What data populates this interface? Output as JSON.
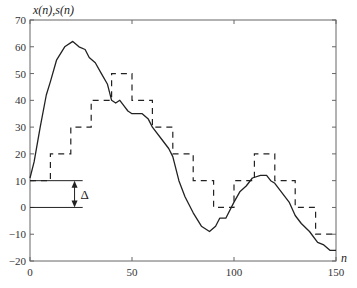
{
  "chart_data": {
    "type": "line",
    "title": "",
    "ylabel": "x(n),s(n)",
    "xlabel": "n",
    "xlim": [
      0,
      150
    ],
    "ylim": [
      -20,
      70
    ],
    "xticks": [
      0,
      50,
      100,
      150
    ],
    "yticks": [
      -20,
      -10,
      0,
      10,
      20,
      30,
      40,
      50,
      60,
      70
    ],
    "grid": false,
    "legend": null,
    "series": [
      {
        "name": "x(n)",
        "style": "solid",
        "x": [
          0,
          2,
          5,
          8,
          10,
          13,
          17,
          21,
          24,
          27,
          29,
          32,
          35,
          38,
          40,
          42,
          44,
          46,
          48,
          50,
          55,
          58,
          60,
          65,
          68,
          70,
          73,
          76,
          80,
          84,
          88,
          91,
          93,
          96,
          100,
          103,
          106,
          109,
          113,
          116,
          118,
          120,
          123,
          127,
          130,
          133,
          137,
          141,
          144,
          147,
          150
        ],
        "values": [
          11,
          17,
          30,
          42,
          47,
          55,
          60,
          62,
          60,
          59,
          56,
          54,
          50,
          46,
          40,
          39,
          40,
          38,
          36,
          35,
          35,
          33,
          30,
          25,
          22,
          19,
          10,
          4,
          -2,
          -7,
          -9,
          -7,
          -4,
          -4,
          2,
          6,
          8,
          11,
          12,
          12,
          10,
          9,
          6,
          2,
          -3,
          -6,
          -9,
          -13,
          -14,
          -16,
          -16
        ]
      },
      {
        "name": "s(n)",
        "style": "dashed",
        "step_edges": [
          0,
          10,
          20,
          30,
          40,
          50,
          60,
          70,
          80,
          90,
          100,
          110,
          120,
          130,
          140,
          150
        ],
        "values": [
          10,
          20,
          30,
          40,
          50,
          40,
          30,
          20,
          10,
          0,
          10,
          20,
          10,
          0,
          -10
        ]
      }
    ],
    "annotations": [
      {
        "text": "Δ",
        "type": "double-arrow",
        "from_y": 0,
        "to_y": 10,
        "x_range": [
          0,
          17
        ],
        "arrow_x": 14
      }
    ]
  }
}
